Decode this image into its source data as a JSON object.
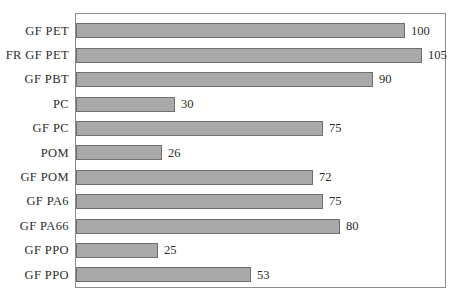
{
  "chart_data": {
    "type": "bar",
    "orientation": "horizontal",
    "title": "",
    "subtitle": "",
    "xlabel": "",
    "ylabel": "",
    "xlim": [
      0,
      112
    ],
    "grid": false,
    "legend": null,
    "bar_color": "#a9a9a9",
    "bar_border_color": "#6e6e6e",
    "frame_color": "#8c8c8c",
    "background": "#ffffff",
    "categories": [
      "GF PET",
      "FR GF PET",
      "GF PBT",
      "PC",
      "GF PC",
      "POM",
      "GF POM",
      "GF PA6",
      "GF PA66",
      "GF PPO",
      "GF PPO"
    ],
    "values": [
      100,
      105,
      90,
      30,
      75,
      26,
      72,
      75,
      80,
      25,
      53
    ],
    "data_labels": [
      "100",
      "105",
      "90",
      "30",
      "75",
      "26",
      "72",
      "75",
      "80",
      "25",
      "53"
    ],
    "bars": [
      {
        "label": "GF PET",
        "value": 100,
        "display": "100"
      },
      {
        "label": "FR GF PET",
        "value": 105,
        "display": "105"
      },
      {
        "label": "GF PBT",
        "value": 90,
        "display": "90"
      },
      {
        "label": "PC",
        "value": 30,
        "display": "30"
      },
      {
        "label": "GF PC",
        "value": 75,
        "display": "75"
      },
      {
        "label": "POM",
        "value": 26,
        "display": "26"
      },
      {
        "label": "GF POM",
        "value": 72,
        "display": "72"
      },
      {
        "label": "GF PA6",
        "value": 75,
        "display": "75"
      },
      {
        "label": "GF PA66",
        "value": 80,
        "display": "80"
      },
      {
        "label": "GF PPO",
        "value": 25,
        "display": "25"
      },
      {
        "label": "GF PPO",
        "value": 53,
        "display": "53"
      }
    ]
  }
}
